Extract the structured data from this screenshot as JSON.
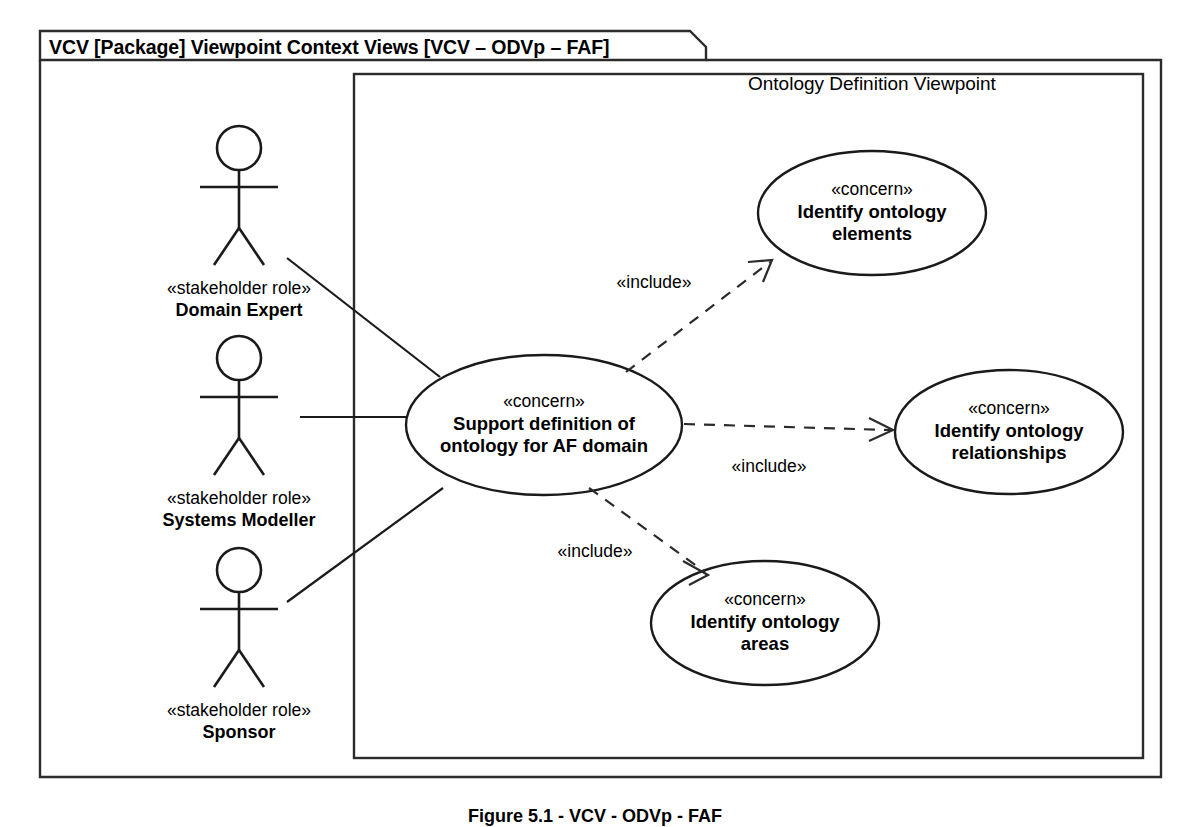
{
  "diagram": {
    "type": "uml-use-case-diagram",
    "frame_title": "VCV [Package] Viewpoint Context Views [VCV – ODVp – FAF]",
    "boundary_title": "Ontology Definition Viewpoint",
    "figure_caption": "Figure 5.1 - VCV - ODVp - FAF",
    "stereotype_concern": "«concern»",
    "stereotype_stakeholder": "«stakeholder role»",
    "stereotype_include": "«include»",
    "colors": {
      "stroke": "#1a1a1a",
      "frame_stroke": "#2b2b2b",
      "fill": "#ffffff",
      "text": "#000000"
    }
  },
  "actors": [
    {
      "id": "domain-expert",
      "stereotype": "«stakeholder role»",
      "name": "Domain Expert"
    },
    {
      "id": "systems-modeller",
      "stereotype": "«stakeholder role»",
      "name": "Systems Modeller"
    },
    {
      "id": "sponsor",
      "stereotype": "«stakeholder role»",
      "name": "Sponsor"
    }
  ],
  "use_cases": [
    {
      "id": "support-definition",
      "stereotype": "«concern»",
      "name_line1": "Support definition of",
      "name_line2": "ontology for AF domain"
    },
    {
      "id": "identify-elements",
      "stereotype": "«concern»",
      "name_line1": "Identify ontology",
      "name_line2": "elements"
    },
    {
      "id": "identify-relationships",
      "stereotype": "«concern»",
      "name_line1": "Identify ontology",
      "name_line2": "relationships"
    },
    {
      "id": "identify-areas",
      "stereotype": "«concern»",
      "name_line1": "Identify ontology",
      "name_line2": "areas"
    }
  ],
  "relationships": [
    {
      "id": "include-elements",
      "label": "«include»",
      "from": "support-definition",
      "to": "identify-elements"
    },
    {
      "id": "include-relationships",
      "label": "«include»",
      "from": "support-definition",
      "to": "identify-relationships"
    },
    {
      "id": "include-areas",
      "label": "«include»",
      "from": "support-definition",
      "to": "identify-areas"
    }
  ]
}
